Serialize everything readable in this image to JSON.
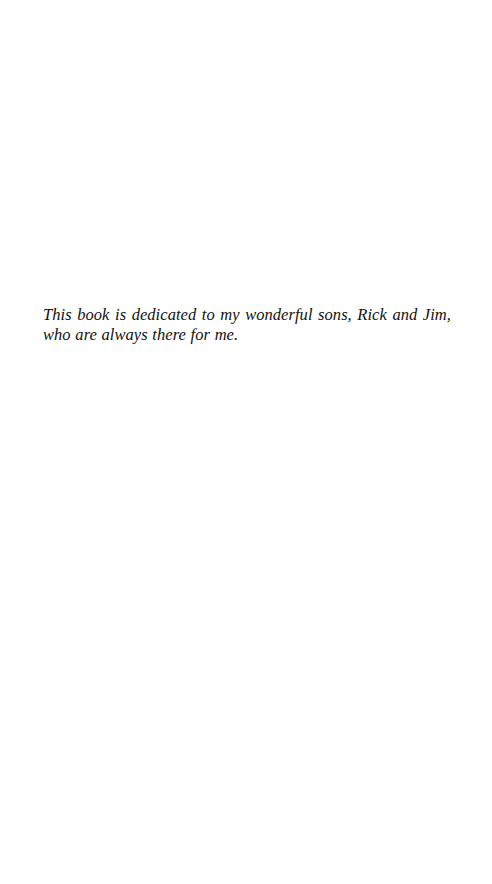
{
  "page": {
    "background": "#ffffff",
    "text_color": "#111111"
  },
  "dedication": {
    "text": "This book is dedicated to my wonderful sons, Rick and Jim, who are always there for me."
  }
}
